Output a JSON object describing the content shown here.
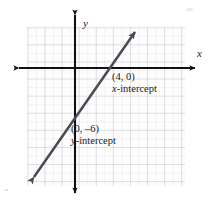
{
  "figure": {
    "name": "linear-graph-intercepts",
    "background_color": "#ffffff"
  },
  "axes": {
    "x_label": "x",
    "y_label": "y",
    "color": "#111111",
    "grid_color": "#9696a5",
    "grid_cells_x": 18,
    "grid_cells_y": 18,
    "origin": {
      "x": 75,
      "y": 68
    }
  },
  "line": {
    "color": "#4a4a52",
    "arrow_both_ends": true,
    "start": {
      "x": 33,
      "y": 178
    },
    "end": {
      "x": 136,
      "y": 31
    }
  },
  "labels": {
    "x_intercept": {
      "point": "(4, 0)",
      "caption_italic": "x",
      "caption_rest": "-intercept"
    },
    "y_intercept": {
      "point": "(0, –6)",
      "caption_italic": "y",
      "caption_rest": "-intercept"
    }
  }
}
